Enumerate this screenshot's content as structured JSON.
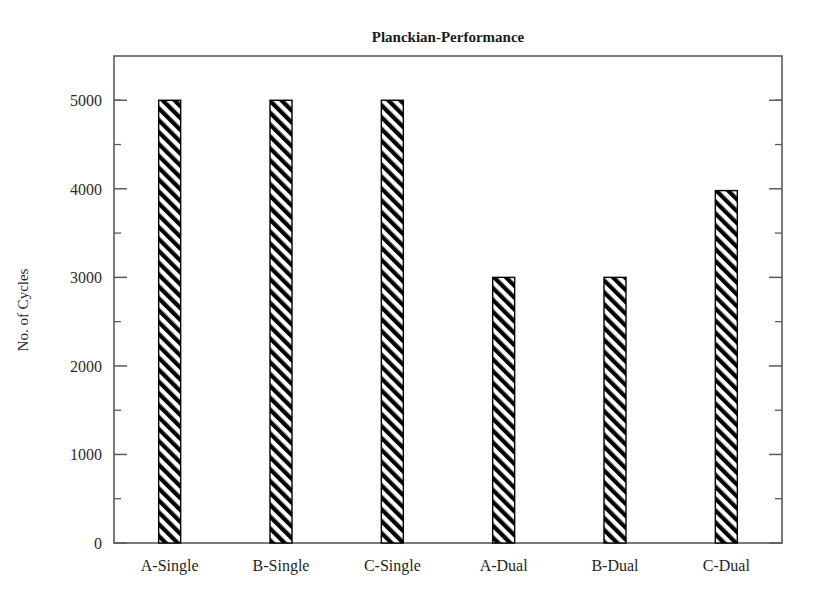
{
  "chart_data": {
    "type": "bar",
    "title": "Planckian-Performance",
    "xlabel": "",
    "ylabel": "No. of Cycles",
    "categories": [
      "A-Single",
      "B-Single",
      "C-Single",
      "A-Dual",
      "B-Dual",
      "C-Dual"
    ],
    "values": [
      5000,
      5000,
      5000,
      3000,
      3000,
      3980
    ],
    "ylim": [
      0,
      5500
    ],
    "ytick_labels": [
      "0",
      "1000",
      "2000",
      "3000",
      "4000",
      "5000"
    ],
    "ytick_values": [
      0,
      1000,
      2000,
      3000,
      4000,
      5000
    ],
    "yminor_values": [
      500,
      1500,
      2500,
      3500,
      4500,
      5000.5
    ],
    "grid": "off",
    "legend": "none",
    "bar_style": {
      "fill": "hatch-diagonal",
      "hatch_color": "#000000",
      "background_color": "#ffffff",
      "edge_color": "#000000"
    },
    "frame": "box",
    "tick_direction": "in",
    "plot_background": "#ffffff"
  }
}
